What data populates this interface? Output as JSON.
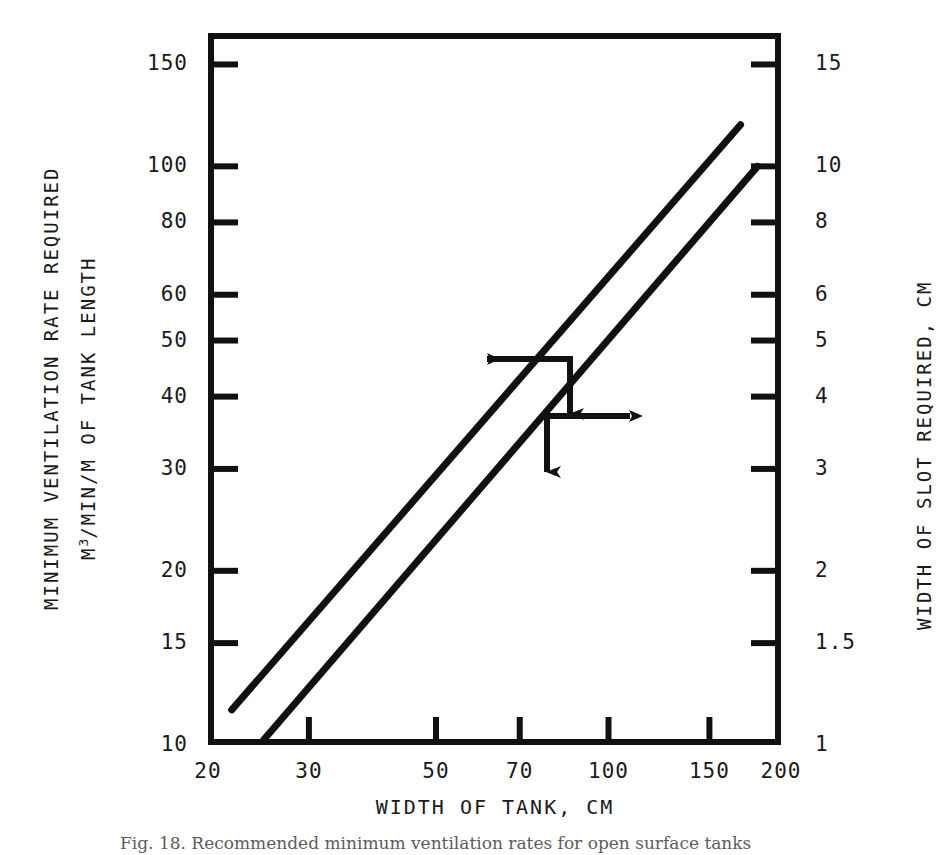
{
  "chart_data": {
    "type": "line",
    "title": "",
    "xlabel": "WIDTH OF TANK, CM",
    "ylabel": "MINIMUM VENTILATION RATE REQUIRED",
    "ylabel_line2_prefix": "M",
    "ylabel_line2_sup": "3",
    "ylabel_line2_rest": "/MIN/M OF TANK LENGTH",
    "y2label": "WIDTH OF SLOT REQUIRED, CM",
    "xscale": "log",
    "yscale": "log",
    "xlim": [
      20,
      200
    ],
    "ylim": [
      10,
      170
    ],
    "y2lim": [
      1,
      17
    ],
    "grid": false,
    "legend": "none",
    "xticks": [
      {
        "value": 20,
        "label": "20"
      },
      {
        "value": 30,
        "label": "30"
      },
      {
        "value": 50,
        "label": "50"
      },
      {
        "value": 70,
        "label": "70"
      },
      {
        "value": 100,
        "label": "100"
      },
      {
        "value": 150,
        "label": "150"
      },
      {
        "value": 200,
        "label": "200"
      }
    ],
    "yticks_left": [
      {
        "value": 150,
        "label": "150"
      },
      {
        "value": 100,
        "label": "100"
      },
      {
        "value": 80,
        "label": "80"
      },
      {
        "value": 60,
        "label": "60"
      },
      {
        "value": 50,
        "label": "50"
      },
      {
        "value": 40,
        "label": "40"
      },
      {
        "value": 30,
        "label": "30"
      },
      {
        "value": 20,
        "label": "20"
      },
      {
        "value": 15,
        "label": "15"
      },
      {
        "value": 10,
        "label": "10"
      }
    ],
    "yticks_right": [
      {
        "value": 15,
        "label": "15"
      },
      {
        "value": 10,
        "label": "10"
      },
      {
        "value": 8,
        "label": "8"
      },
      {
        "value": 6,
        "label": "6"
      },
      {
        "value": 5,
        "label": "5"
      },
      {
        "value": 4,
        "label": "4"
      },
      {
        "value": 3,
        "label": "3"
      },
      {
        "value": 2,
        "label": "2"
      },
      {
        "value": 1.5,
        "label": "1.5"
      },
      {
        "value": 1,
        "label": "1"
      }
    ],
    "series": [
      {
        "name": "Minimum ventilation rate required",
        "axis": "left",
        "points": [
          {
            "x": 22,
            "y": 11.5
          },
          {
            "x": 170,
            "y": 118
          }
        ]
      },
      {
        "name": "Width of slot required",
        "axis": "right",
        "points": [
          {
            "x": 25,
            "y": 1.02
          },
          {
            "x": 182,
            "y": 10.0
          }
        ]
      }
    ],
    "annotations": [
      {
        "name": "left-axis-pointer",
        "direction": "left-and-down",
        "at_x": 85,
        "at_y": 48,
        "target": "left"
      },
      {
        "name": "right-axis-pointer",
        "direction": "right-and-down",
        "at_x": 85,
        "at_y": 39,
        "target": "right"
      }
    ],
    "colors": {
      "line": "#111111",
      "frame": "#111111",
      "text": "#1a1a1a",
      "background": "#ffffff"
    }
  },
  "caption": {
    "text": "Fig. 18. Recommended minimum ventilation rates for open surface tanks"
  }
}
